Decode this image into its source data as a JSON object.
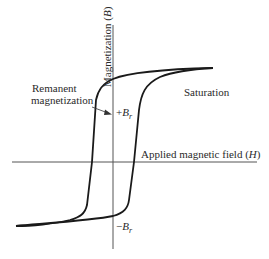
{
  "diagram": {
    "type": "hysteresis-loop",
    "axes": {
      "x_label": "Applied magnetic field",
      "x_symbol": "H",
      "y_label": "Magnetization",
      "y_symbol": "B"
    },
    "annotations": {
      "remanent_line1": "Remanent",
      "remanent_line2": "magnetization",
      "saturation": "Saturation",
      "plus_br_sign": "+",
      "minus_br_sign": "−",
      "br_symbol": "B",
      "br_sub": "r"
    },
    "colors": {
      "curve": "#1a1a1a",
      "axis": "#555555",
      "text": "#2a2a2a",
      "background": "#ffffff"
    }
  }
}
